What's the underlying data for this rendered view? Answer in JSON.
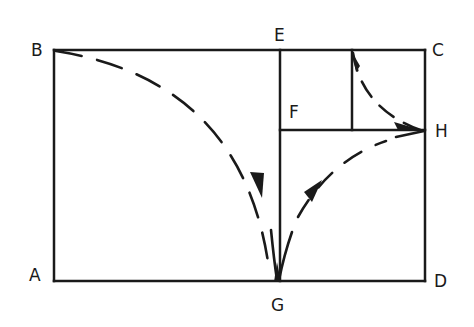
{
  "diagram": {
    "type": "golden-rectangle-construction",
    "points": {
      "A": {
        "label": "A",
        "x": 54,
        "y": 281
      },
      "B": {
        "label": "B",
        "x": 54,
        "y": 50
      },
      "C": {
        "label": "C",
        "x": 425,
        "y": 50
      },
      "D": {
        "label": "D",
        "x": 425,
        "y": 281
      },
      "E": {
        "label": "E",
        "x": 280,
        "y": 50
      },
      "F": {
        "label": "F",
        "x": 280,
        "y": 130
      },
      "G": {
        "label": "G",
        "x": 277,
        "y": 281
      },
      "H": {
        "label": "H",
        "x": 425,
        "y": 130
      }
    },
    "edges": [
      [
        "A",
        "B"
      ],
      [
        "B",
        "C"
      ],
      [
        "C",
        "D"
      ],
      [
        "D",
        "A"
      ],
      [
        "E",
        "G"
      ],
      [
        "F",
        "H"
      ],
      [
        "inner_top",
        "inner_bottom"
      ]
    ],
    "arcs": [
      {
        "from": "B",
        "to": "G",
        "style": "dashed",
        "arrow": "at G"
      },
      {
        "from": "G",
        "to": "H",
        "style": "dashed",
        "arrow": "at H"
      },
      {
        "from": "inner_top",
        "to": "H",
        "style": "dashed",
        "arrow": "at H"
      }
    ]
  }
}
